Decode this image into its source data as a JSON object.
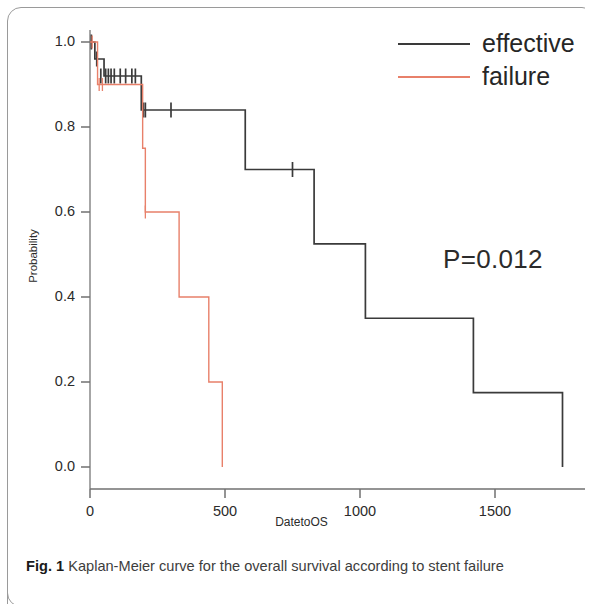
{
  "figure": {
    "caption_number": "Fig. 1",
    "caption_text": "Kaplan-Meier curve for the overall survival according to stent failure"
  },
  "annotation": {
    "pvalue": "P=0.012"
  },
  "legend": {
    "position": "top-right",
    "entries": [
      {
        "label": "effective",
        "color": "#3a3a3a"
      },
      {
        "label": "failure",
        "color": "#e8806a"
      }
    ]
  },
  "axes": {
    "x": {
      "label": "DatetoOS",
      "ticks": [
        "0",
        "500",
        "1000",
        "1500"
      ],
      "tick_values": [
        0,
        500,
        1000,
        1500
      ],
      "range": [
        -60,
        1820
      ]
    },
    "y": {
      "label": "Probability",
      "ticks": [
        "1.0",
        "0.8",
        "0.6",
        "0.4",
        "0.2",
        "0.0"
      ],
      "tick_values": [
        1.0,
        0.8,
        0.6,
        0.4,
        0.2,
        0.0
      ],
      "range": [
        0.0,
        1.0
      ]
    }
  },
  "chart_data": {
    "type": "line",
    "subtype": "kaplan-meier-step",
    "title": "",
    "xlabel": "DatetoOS",
    "ylabel": "Probability",
    "xlim": [
      -60,
      1820
    ],
    "ylim": [
      -0.03,
      1.03
    ],
    "grid": false,
    "legend_position": "top-right",
    "annotations": [
      {
        "text": "P=0.012",
        "x": 1320,
        "y": 0.48
      }
    ],
    "series": [
      {
        "name": "effective",
        "color": "#3a3a3a",
        "steps": [
          {
            "x": 0,
            "y": 1.0
          },
          {
            "x": 18,
            "y": 0.96
          },
          {
            "x": 52,
            "y": 0.92
          },
          {
            "x": 190,
            "y": 0.84
          },
          {
            "x": 575,
            "y": 0.7
          },
          {
            "x": 830,
            "y": 0.525
          },
          {
            "x": 1020,
            "y": 0.35
          },
          {
            "x": 1420,
            "y": 0.175
          },
          {
            "x": 1750,
            "y": 0.175
          }
        ],
        "censor_marks": [
          {
            "x": 5,
            "y": 1.0
          },
          {
            "x": 25,
            "y": 0.96
          },
          {
            "x": 40,
            "y": 0.92
          },
          {
            "x": 58,
            "y": 0.92
          },
          {
            "x": 68,
            "y": 0.92
          },
          {
            "x": 78,
            "y": 0.92
          },
          {
            "x": 90,
            "y": 0.92
          },
          {
            "x": 112,
            "y": 0.92
          },
          {
            "x": 132,
            "y": 0.92
          },
          {
            "x": 155,
            "y": 0.92
          },
          {
            "x": 168,
            "y": 0.92
          },
          {
            "x": 198,
            "y": 0.84
          },
          {
            "x": 205,
            "y": 0.84
          },
          {
            "x": 300,
            "y": 0.84
          },
          {
            "x": 750,
            "y": 0.7
          }
        ],
        "terminal_drop": {
          "x": 1750,
          "to_y": 0.0
        }
      },
      {
        "name": "failure",
        "color": "#e8806a",
        "steps": [
          {
            "x": 0,
            "y": 1.0
          },
          {
            "x": 28,
            "y": 0.9
          },
          {
            "x": 195,
            "y": 0.75
          },
          {
            "x": 205,
            "y": 0.6
          },
          {
            "x": 330,
            "y": 0.4
          },
          {
            "x": 440,
            "y": 0.2
          },
          {
            "x": 490,
            "y": 0.2
          }
        ],
        "censor_marks": [
          {
            "x": 8,
            "y": 1.0
          },
          {
            "x": 34,
            "y": 0.9
          },
          {
            "x": 46,
            "y": 0.9
          },
          {
            "x": 205,
            "y": 0.6
          }
        ],
        "terminal_drop": {
          "x": 490,
          "to_y": 0.0
        }
      }
    ]
  },
  "plot_geometry": {
    "x_pixel_at_zero": 90,
    "x_pixels_per_unit": 0.27,
    "y_pixel_at_one": 42,
    "y_pixel_at_zero": 467,
    "axis_line_y": 489,
    "axis_line_x": 90
  }
}
